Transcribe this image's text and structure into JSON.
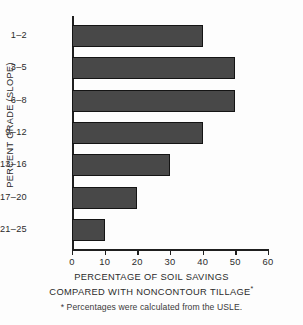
{
  "chart_data": {
    "type": "bar",
    "orientation": "horizontal",
    "title": "",
    "categories": [
      "1–2",
      "3–5",
      "6–8",
      "9–12",
      "13–16",
      "17–20",
      "21–25"
    ],
    "values": [
      40,
      50,
      50,
      40,
      30,
      20,
      10
    ],
    "xlabel_line1": "PERCENTAGE OF SOIL SAVINGS",
    "xlabel_line2": "COMPARED WITH NONCONTOUR TILLAGE",
    "xlabel_marker": "*",
    "ylabel": "PERCENT GRADE (SLOPE)",
    "xlim": [
      0,
      60
    ],
    "xticks": [
      0,
      10,
      20,
      30,
      40,
      50,
      60
    ],
    "xtick_labels": [
      "0",
      "10",
      "20",
      "30",
      "40",
      "50",
      "60"
    ],
    "grid": false,
    "legend": "none",
    "bar_color": "#484848",
    "bar_edge_color": "#141414",
    "axis_color": "#1f1f1f",
    "background": "#fdfdfd",
    "footnote": "* Percentages were calculated from the USLE."
  }
}
